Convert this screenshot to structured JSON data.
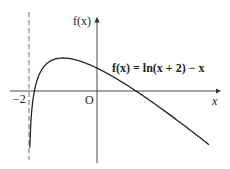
{
  "diagram": {
    "function_label": "f(x) = ln(x + 2) − x",
    "y_axis_label": "f(x)",
    "x_axis_label": "x",
    "origin_label": "O",
    "asymptote_label": "−2",
    "colors": {
      "curve": "#222222",
      "axes": "#333333",
      "asymptote": "#444444",
      "background": "#ffffff"
    }
  },
  "chart_data": {
    "type": "line",
    "title": "f(x) = ln(x + 2) − x",
    "xlabel": "x",
    "ylabel": "f(x)",
    "vertical_asymptote": -2,
    "key_points": [
      {
        "x": -1.84,
        "y": 0,
        "note": "x-intercept"
      },
      {
        "x": -1,
        "y": 1,
        "note": "maximum"
      },
      {
        "x": 0,
        "y": 0.693,
        "note": "y-intercept"
      },
      {
        "x": 1.15,
        "y": 0,
        "note": "x-intercept"
      }
    ],
    "x_range": [
      -2,
      3.3
    ],
    "grid": false
  }
}
